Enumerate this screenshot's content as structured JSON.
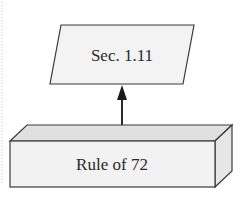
{
  "diagram": {
    "nodes": [
      {
        "id": "sec",
        "shape": "parallelogram",
        "label": "Sec. 1.11"
      },
      {
        "id": "rule72",
        "shape": "3d-box",
        "label": "Rule of 72"
      }
    ],
    "edges": [
      {
        "from": "rule72",
        "to": "sec",
        "style": "arrow"
      }
    ]
  },
  "colors": {
    "stroke": "#3a3a3a",
    "fill_light": "#f2f2f2",
    "fill_top": "#e2e2e2",
    "fill_side": "#e8e8e8"
  }
}
